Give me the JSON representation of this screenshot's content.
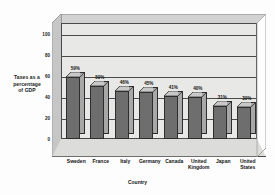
{
  "chart_data": {
    "type": "bar",
    "title": "",
    "xlabel": "Country",
    "ylabel": "Taxes as a percentage of GDP",
    "categories": [
      "Sweden",
      "France",
      "Italy",
      "Germany",
      "Canada",
      "United Kingdom",
      "Japan",
      "United States"
    ],
    "values": [
      59,
      50,
      46,
      45,
      41,
      40,
      31,
      30
    ],
    "data_labels": [
      "59%",
      "50%",
      "46%",
      "45%",
      "41%",
      "40%",
      "31%",
      "30%"
    ],
    "ylim": [
      0,
      110
    ],
    "ytick_labels": [
      "100",
      "80",
      "60",
      "40",
      "20",
      "0"
    ],
    "ytick_values": [
      100,
      80,
      60,
      40,
      20,
      0
    ],
    "grid": true,
    "legend": false,
    "style": "3d-column",
    "colors": {
      "bar_front": "#6e6e6e",
      "bar_side": "#a8a8a8",
      "bar_top": "#c8c8c8",
      "panel": "#e8e8e6",
      "floor": "#dcdcda",
      "wall_left": "#c6c6c6",
      "wall_top": "#d2d2d2",
      "axis": "#4a4a4a",
      "background": "#fdfdfd"
    }
  },
  "axis_titles": {
    "y_line1": "Taxes as a",
    "y_line2": "percentage",
    "y_line3": "of GDP",
    "x": "Country"
  },
  "category_lines": [
    [
      "Sweden",
      ""
    ],
    [
      "France",
      ""
    ],
    [
      "Italy",
      ""
    ],
    [
      "Germany",
      ""
    ],
    [
      "Canada",
      ""
    ],
    [
      "United",
      "Kingdom"
    ],
    [
      "Japan",
      ""
    ],
    [
      "United",
      "States"
    ]
  ]
}
